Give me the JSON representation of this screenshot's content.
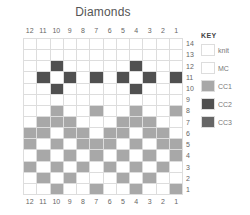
{
  "chart": {
    "title": "Diamonds",
    "columns": [
      "12",
      "11",
      "10",
      "9",
      "8",
      "7",
      "6",
      "5",
      "4",
      "3",
      "2",
      "1"
    ],
    "rows": [
      "14",
      "13",
      "12",
      "11",
      "10",
      "9",
      "8",
      "7",
      "6",
      "5",
      "4",
      "3",
      "2",
      "1"
    ],
    "grid": [
      [
        "",
        "",
        "",
        "",
        "",
        "",
        "",
        "",
        "",
        "",
        "",
        ""
      ],
      [
        "",
        "",
        "",
        "",
        "",
        "",
        "",
        "",
        "",
        "",
        "",
        ""
      ],
      [
        "",
        "",
        "CC2",
        "",
        "",
        "",
        "",
        "",
        "CC2",
        "",
        "",
        ""
      ],
      [
        "",
        "CC2",
        "",
        "CC2",
        "",
        "CC2",
        "",
        "CC2",
        "",
        "CC2",
        "",
        "CC2"
      ],
      [
        "",
        "",
        "CC2",
        "",
        "",
        "",
        "",
        "",
        "CC2",
        "",
        "",
        ""
      ],
      [
        "",
        "",
        "",
        "",
        "",
        "",
        "",
        "",
        "",
        "",
        "",
        ""
      ],
      [
        "",
        "",
        "CC1",
        "",
        "",
        "CC1",
        "",
        "",
        "CC1",
        "",
        "",
        "CC1"
      ],
      [
        "",
        "CC1",
        "CC1",
        "CC1",
        "",
        "",
        "",
        "CC1",
        "CC1",
        "CC1",
        "",
        ""
      ],
      [
        "CC1",
        "CC1",
        "",
        "CC1",
        "CC1",
        "",
        "CC1",
        "CC1",
        "",
        "CC1",
        "CC1",
        ""
      ],
      [
        "CC1",
        "",
        "CC1",
        "",
        "CC1",
        "CC1",
        "CC1",
        "",
        "CC1",
        "",
        "CC1",
        "CC1"
      ],
      [
        "",
        "CC1",
        "",
        "CC1",
        "",
        "CC1",
        "",
        "CC1",
        "",
        "CC1",
        "",
        "CC1"
      ],
      [
        "CC1",
        "",
        "CC1",
        "",
        "CC1",
        "",
        "CC1",
        "",
        "CC1",
        "",
        "CC1",
        ""
      ],
      [
        "",
        "CC1",
        "",
        "CC1",
        "",
        "",
        "",
        "CC1",
        "",
        "CC1",
        "",
        ""
      ],
      [
        "",
        "",
        "CC1",
        "",
        "",
        "CC1",
        "",
        "",
        "CC1",
        "",
        "",
        "CC1"
      ]
    ]
  },
  "key": {
    "title": "KEY",
    "items": [
      {
        "label": "knit",
        "color": "#ffffff"
      },
      {
        "label": "MC",
        "color": "#ffffff"
      },
      {
        "label": "CC1",
        "color": "#a8a8a8"
      },
      {
        "label": "CC2",
        "color": "#505050"
      },
      {
        "label": "CC3",
        "color": "#666666"
      }
    ]
  }
}
